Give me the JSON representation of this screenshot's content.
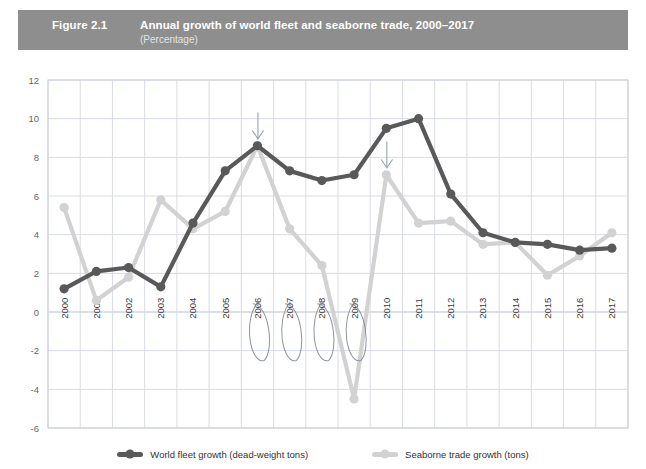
{
  "header": {
    "figure_number": "Figure 2.1",
    "title": "Annual growth of world fleet and seaborne trade, 2000–2017",
    "subtitle": "(Percentage)",
    "band_color": "#8e8e8e"
  },
  "legend": {
    "position": "bottom-center",
    "items": [
      {
        "label": "World fleet growth (dead-weight tons)",
        "color": "#595959"
      },
      {
        "label": "Seaborne trade growth (tons)",
        "color": "#d2d2d2"
      }
    ]
  },
  "annotations": {
    "ovals": [
      {
        "label": "oval-2006",
        "year": "2006"
      },
      {
        "label": "oval-2007",
        "year": "2007"
      },
      {
        "label": "oval-2008",
        "year": "2008"
      },
      {
        "label": "oval-2009",
        "year": "2009"
      }
    ],
    "arrows": [
      {
        "label": "arrow-2006",
        "year": "2006",
        "direction": "down",
        "value": 8.6
      },
      {
        "label": "arrow-2010",
        "year": "2010",
        "direction": "down",
        "value": 7.1
      }
    ]
  },
  "chart_data": {
    "type": "line",
    "title": "Annual growth of world fleet and seaborne trade, 2000–2017",
    "subtitle": "(Percentage)",
    "xlabel": "",
    "ylabel": "",
    "ylim": [
      -6,
      12
    ],
    "ytick_step": 2,
    "yticks": [
      12,
      10,
      8,
      6,
      4,
      2,
      0,
      -2,
      -4,
      -6
    ],
    "grid": true,
    "legend_position": "bottom-center",
    "categories": [
      "2000",
      "2001",
      "2002",
      "2003",
      "2004",
      "2005",
      "2006",
      "2007",
      "2008",
      "2009",
      "2010",
      "2011",
      "2012",
      "2013",
      "2014",
      "2015",
      "2016",
      "2017"
    ],
    "series": [
      {
        "name": "World fleet growth (dead-weight tons)",
        "color": "#595959",
        "values": [
          1.2,
          2.1,
          2.3,
          1.3,
          4.6,
          7.3,
          8.6,
          7.3,
          6.8,
          7.1,
          9.5,
          10.0,
          6.1,
          4.1,
          3.6,
          3.5,
          3.2,
          3.3
        ]
      },
      {
        "name": "Seaborne trade growth (tons)",
        "color": "#d2d2d2",
        "values": [
          5.4,
          0.6,
          1.8,
          5.8,
          4.3,
          5.2,
          8.6,
          4.3,
          2.4,
          -4.5,
          7.1,
          4.6,
          4.7,
          3.5,
          3.6,
          1.9,
          2.9,
          4.1
        ]
      }
    ]
  }
}
